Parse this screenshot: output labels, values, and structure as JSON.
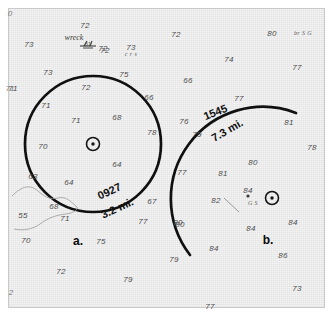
{
  "figure": {
    "paper_color": "#f4f4f4",
    "ink_color": "#101010",
    "sounding_color": "#4c4c4c"
  },
  "chart_data": {
    "type": "scatter",
    "xlabel": "",
    "ylabel": "",
    "grid": false,
    "legend": "none",
    "annotations": [
      {
        "name": "wreck-label",
        "text": "wreck",
        "x": 74,
        "y": 37
      },
      {
        "name": "wreck-depth",
        "text": "61",
        "x": 97,
        "y": 48
      },
      {
        "name": "bottom-type-crs",
        "text": "c r s",
        "x": 131,
        "y": 54
      },
      {
        "name": "bottom-type-brsg",
        "text": "br S G",
        "x": 303,
        "y": 33
      },
      {
        "name": "bottom-type-gs",
        "text": "G S",
        "x": 253,
        "y": 203
      },
      {
        "name": "arc-a-time",
        "text": "0927",
        "x": 114,
        "y": 193,
        "rotate": -24
      },
      {
        "name": "arc-a-range",
        "text": "3.2 mi.",
        "x": 124,
        "y": 209,
        "rotate": -24
      },
      {
        "name": "arc-b-time",
        "text": "1545",
        "x": 219,
        "y": 115,
        "rotate": -22
      },
      {
        "name": "arc-b-range",
        "text": "7.3 mi.",
        "x": 228,
        "y": 131,
        "rotate": -30
      },
      {
        "name": "figure-label-a",
        "text": "a.",
        "x": 78,
        "y": 241
      },
      {
        "name": "figure-label-b",
        "text": "b.",
        "x": 268,
        "y": 240
      }
    ],
    "edge_marks": [
      {
        "text": "0",
        "x": 10,
        "y": 13
      },
      {
        "text": "71",
        "x": 10,
        "y": 88
      },
      {
        "text": "2",
        "x": 11,
        "y": 292
      }
    ],
    "arcs": [
      {
        "name": "arc-a",
        "label_time": "0927",
        "label_range": "3.2 mi.",
        "center_x": 93,
        "center_y": 144,
        "radius": 68,
        "stroke_width": 2.6
      },
      {
        "name": "arc-b",
        "label_time": "1545",
        "label_range": "7.3 mi.",
        "center_x": 272,
        "center_y": 198,
        "radius": 92,
        "stroke_width": 2.6
      }
    ],
    "fix_symbols": [
      {
        "name": "fix-symbol-a",
        "x": 93,
        "y": 144
      },
      {
        "name": "fix-symbol-b",
        "x": 272,
        "y": 198
      }
    ],
    "soundings": [
      {
        "value": "73",
        "x": 29,
        "y": 44
      },
      {
        "value": "72",
        "x": 85,
        "y": 25
      },
      {
        "value": "72",
        "x": 105,
        "y": 50
      },
      {
        "value": "73",
        "x": 131,
        "y": 47
      },
      {
        "value": "72",
        "x": 176,
        "y": 34
      },
      {
        "value": "80",
        "x": 272,
        "y": 33
      },
      {
        "value": "73",
        "x": 48,
        "y": 72
      },
      {
        "value": "75",
        "x": 124,
        "y": 74
      },
      {
        "value": "74",
        "x": 229,
        "y": 59
      },
      {
        "value": "77",
        "x": 297,
        "y": 67
      },
      {
        "value": "71",
        "x": 13,
        "y": 88
      },
      {
        "value": "72",
        "x": 86,
        "y": 87
      },
      {
        "value": "66",
        "x": 149,
        "y": 97
      },
      {
        "value": "66",
        "x": 188,
        "y": 80
      },
      {
        "value": "71",
        "x": 46,
        "y": 105
      },
      {
        "value": "71",
        "x": 76,
        "y": 120
      },
      {
        "value": "68",
        "x": 117,
        "y": 117
      },
      {
        "value": "76",
        "x": 184,
        "y": 121
      },
      {
        "value": "77",
        "x": 239,
        "y": 98
      },
      {
        "value": "79",
        "x": 197,
        "y": 134
      },
      {
        "value": "81",
        "x": 289,
        "y": 122
      },
      {
        "value": "78",
        "x": 152,
        "y": 132
      },
      {
        "value": "78",
        "x": 312,
        "y": 147
      },
      {
        "value": "70",
        "x": 43,
        "y": 146
      },
      {
        "value": "64",
        "x": 117,
        "y": 164
      },
      {
        "value": "63",
        "x": 33,
        "y": 176
      },
      {
        "value": "64",
        "x": 69,
        "y": 182
      },
      {
        "value": "77",
        "x": 182,
        "y": 172
      },
      {
        "value": "81",
        "x": 223,
        "y": 173
      },
      {
        "value": "80",
        "x": 253,
        "y": 162
      },
      {
        "value": "55",
        "x": 23,
        "y": 215
      },
      {
        "value": "68",
        "x": 54,
        "y": 206
      },
      {
        "value": "71",
        "x": 65,
        "y": 218
      },
      {
        "value": "67",
        "x": 152,
        "y": 201
      },
      {
        "value": "82",
        "x": 216,
        "y": 200
      },
      {
        "value": "84",
        "x": 248,
        "y": 190
      },
      {
        "value": "84",
        "x": 251,
        "y": 228
      },
      {
        "value": "84",
        "x": 293,
        "y": 222
      },
      {
        "value": "77",
        "x": 143,
        "y": 221
      },
      {
        "value": "80",
        "x": 180,
        "y": 224
      },
      {
        "value": "70",
        "x": 26,
        "y": 240
      },
      {
        "value": "75",
        "x": 101,
        "y": 241
      },
      {
        "value": "80",
        "x": 178,
        "y": 222
      },
      {
        "value": "84",
        "x": 214,
        "y": 248
      },
      {
        "value": "86",
        "x": 283,
        "y": 255
      },
      {
        "value": "72",
        "x": 61,
        "y": 271
      },
      {
        "value": "79",
        "x": 128,
        "y": 279
      },
      {
        "value": "79",
        "x": 174,
        "y": 259
      },
      {
        "value": "73",
        "x": 297,
        "y": 288
      },
      {
        "value": "77",
        "x": 210,
        "y": 306
      }
    ],
    "depth_contour": {
      "name": "depth-contour-line",
      "description": "thin wavy bottom contour at lower left"
    },
    "obstruction_symbols": [
      {
        "name": "obstruction-dot",
        "x": 248,
        "y": 196
      }
    ]
  }
}
